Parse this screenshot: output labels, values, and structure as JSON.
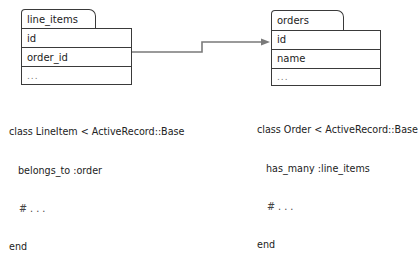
{
  "tables": [
    {
      "name": "line_items",
      "fields": [
        "id",
        "order_id",
        "..."
      ]
    },
    {
      "name": "orders",
      "fields": [
        "id",
        "name",
        "..."
      ]
    }
  ],
  "relationship": {
    "from": "line_items.order_id",
    "to": "orders.id",
    "line_color": "#777777"
  },
  "code": {
    "line_item": {
      "line1": "class LineItem < ActiveRecord::Base",
      "line2": "belongs_to :order",
      "line3": "# . . .",
      "line4": "end"
    },
    "order": {
      "line1": "class Order < ActiveRecord::Base",
      "line2": "has_many :line_items",
      "line3": "# . . .",
      "line4": "end"
    }
  }
}
